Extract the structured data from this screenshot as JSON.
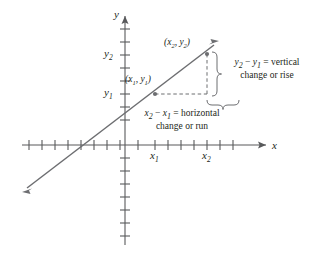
{
  "figure": {
    "type": "coordinate-plane-slope-diagram",
    "background_color": "#ffffff",
    "line_color": "#6d6e71",
    "axis_color": "#58595b",
    "text_color": "#231f20"
  },
  "axes": {
    "x_axis_label": "x",
    "y_axis_label": "y",
    "x_tick_count": 17,
    "y_tick_count": 17,
    "x_tick_labels": [
      "x₁",
      "x₂"
    ],
    "y_tick_labels": [
      "y₁",
      "y₂"
    ]
  },
  "tick_labels": {
    "x1": "x",
    "x1_sub": "1",
    "x2": "x",
    "x2_sub": "2",
    "y1": "y",
    "y1_sub": "1",
    "y2": "y",
    "y2_sub": "2"
  },
  "points": [
    {
      "name": "point-1",
      "label_open": "(",
      "label_x": "x",
      "label_x_sub": "1",
      "label_comma": ", ",
      "label_y": "y",
      "label_y_sub": "1",
      "label_close": ")",
      "label_text": "(x₁, y₁)",
      "px": 155,
      "py": 94
    },
    {
      "name": "point-2",
      "label_open": "(",
      "label_x": "x",
      "label_x_sub": "2",
      "label_comma": ", ",
      "label_y": "y",
      "label_y_sub": "2",
      "label_close": ")",
      "label_text": "(x₂, y₂)",
      "px": 207,
      "py": 54
    }
  ],
  "annotations": {
    "vertical": {
      "expr_a": "y",
      "expr_a_sub": "2",
      "minus": " − ",
      "expr_b": "y",
      "expr_b_sub": "1",
      "equals": " = ",
      "word1": "vertical",
      "line2": "change or rise",
      "full_text": "y₂ − y₁ = vertical change or rise"
    },
    "horizontal": {
      "expr_a": "x",
      "expr_a_sub": "2",
      "minus": " − ",
      "expr_b": "x",
      "expr_b_sub": "1",
      "equals": " = ",
      "word1": "horizontal",
      "line2": "change or run",
      "full_text": "x₂ − x₁ = horizontal change or run"
    }
  }
}
